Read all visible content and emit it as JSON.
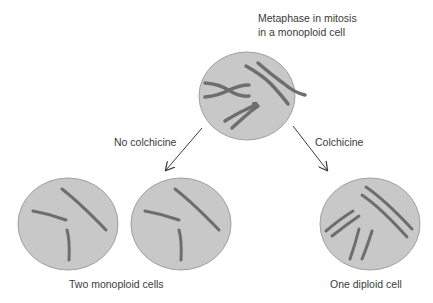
{
  "title_line1": "Metaphase in mitosis",
  "title_line2": "in a monoploid cell",
  "branches": {
    "left": "No colchicine",
    "right": "Colchicine"
  },
  "results": {
    "left": "Two monoploid cells",
    "right": "One diploid cell"
  },
  "colors": {
    "cell_fill": "#c8c8c8",
    "cell_stroke": "#9a9a9a",
    "chromosome": "#6e6e6e",
    "arrow": "#3a3a3a"
  }
}
